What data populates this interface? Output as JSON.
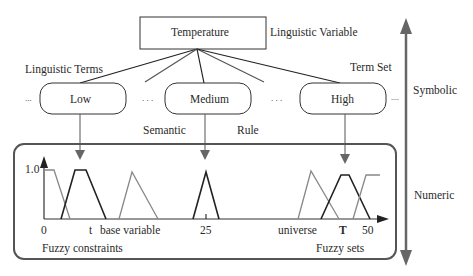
{
  "diagram": {
    "linguistic_variable": {
      "name": "Temperature",
      "label": "Linguistic Variable"
    },
    "labels": {
      "linguistic_terms": "Linguistic Terms",
      "term_set": "Term Set",
      "semantic": "Semantic",
      "rule": "Rule",
      "symbolic": "Symbolic",
      "numeric": "Numeric",
      "fuzzy_constraints": "Fuzzy constraints",
      "fuzzy_sets": "Fuzzy sets"
    },
    "terms": [
      {
        "label": "Low"
      },
      {
        "label": "Medium"
      },
      {
        "label": "High"
      }
    ],
    "ellipses": {
      "left": "...",
      "between_low_medium": ". . .",
      "between_medium_high": ". . .",
      "right": "...."
    },
    "axis": {
      "y_tick": "1.0",
      "origin": "0",
      "t_label": "t",
      "base_variable": "base variable",
      "mid_value": "25",
      "universe": "universe",
      "T_label": "T",
      "max_value": "50"
    },
    "colors": {
      "line_dark": "#222222",
      "line_gray": "#777777",
      "arrow_gray": "#666666",
      "frame": "#555555"
    }
  }
}
